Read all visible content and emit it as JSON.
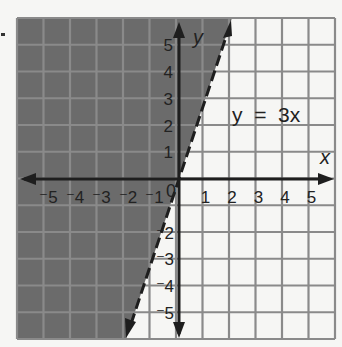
{
  "chart_data": {
    "type": "line",
    "title": "",
    "equation_label": "y = 3x",
    "xlabel": "x",
    "ylabel": "y",
    "xlim": [
      -6,
      6
    ],
    "ylim": [
      -6,
      6
    ],
    "grid": true,
    "x_ticks": [
      "-5",
      "-4",
      "-3",
      "-2",
      "-1",
      "0",
      "1",
      "2",
      "3",
      "4",
      "5"
    ],
    "y_ticks": [
      "5",
      "4",
      "3",
      "2",
      "1",
      "-2",
      "-3",
      "-4",
      "-5"
    ],
    "boundary_line": {
      "slope": 3,
      "intercept": 0,
      "style": "dashed",
      "endpoints": [
        [
          -2,
          -6
        ],
        [
          2,
          6
        ]
      ]
    },
    "shaded_region": "y > 3x (left of line)",
    "colors": {
      "shaded": "#6b6b6b",
      "unshaded": "#f6f6f4",
      "grid": "#8a8a8a",
      "axis": "#222222"
    }
  },
  "labels": {
    "x_axis": "x",
    "y_axis": "y",
    "equation": "y  =  3x",
    "origin": "0"
  }
}
